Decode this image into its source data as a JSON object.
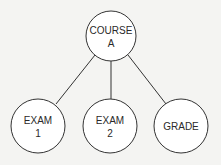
{
  "diagram": {
    "type": "tree",
    "root": {
      "id": "course",
      "lines": [
        "COURSE",
        "A"
      ],
      "cx": 111,
      "cy": 36,
      "r": 25
    },
    "children": [
      {
        "id": "exam1",
        "lines": [
          "EXAM",
          "1"
        ],
        "cx": 38,
        "cy": 126,
        "r": 27
      },
      {
        "id": "exam2",
        "lines": [
          "EXAM",
          "2"
        ],
        "cx": 110,
        "cy": 126,
        "r": 27
      },
      {
        "id": "grade",
        "lines": [
          "GRADE"
        ],
        "cx": 181,
        "cy": 126,
        "r": 27
      }
    ],
    "colors": {
      "stroke": "#333333",
      "fill": "#ffffff",
      "background": "#f4f4f2"
    }
  }
}
